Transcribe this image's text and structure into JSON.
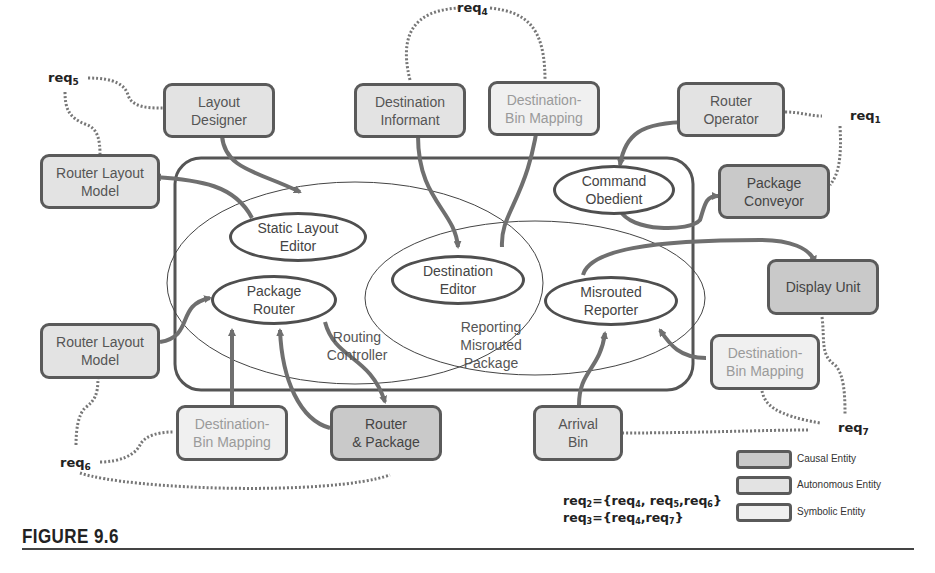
{
  "figure": {
    "caption": "FIGURE 9.6"
  },
  "colors": {
    "causal_fill": "#c9c9c9",
    "autonomous_fill": "#e3e3e3",
    "symbolic_fill": "#f0f0f0",
    "border": "#5a5a5a",
    "arrow": "#6f6f6f"
  },
  "entities": {
    "layout_designer": {
      "label": "Layout\nDesigner",
      "type": "autonomous"
    },
    "destination_informant": {
      "label": "Destination\nInformant",
      "type": "autonomous"
    },
    "dest_bin_mapping_top": {
      "label": "Destination-\nBin Mapping",
      "type": "symbolic"
    },
    "router_operator": {
      "label": "Router\nOperator",
      "type": "autonomous"
    },
    "router_layout_model_top": {
      "label": "Router Layout\nModel",
      "type": "autonomous"
    },
    "package_conveyor": {
      "label": "Package\nConveyor",
      "type": "causal"
    },
    "display_unit": {
      "label": "Display Unit",
      "type": "causal"
    },
    "router_layout_model_bottom": {
      "label": "Router Layout\nModel",
      "type": "autonomous"
    },
    "dest_bin_mapping_right": {
      "label": "Destination-\nBin Mapping",
      "type": "symbolic"
    },
    "dest_bin_mapping_bottom": {
      "label": "Destination-\nBin Mapping",
      "type": "symbolic"
    },
    "router_package": {
      "label": "Router\n& Package",
      "type": "causal"
    },
    "arrival_bin": {
      "label": "Arrival\nBin",
      "type": "autonomous"
    }
  },
  "functions": {
    "static_layout_editor": "Static Layout\nEditor",
    "package_router": "Package\nRouter",
    "destination_editor": "Destination\nEditor",
    "misrouted_reporter": "Misrouted\nReporter",
    "command_obedient": "Command\nObedient"
  },
  "groups": {
    "routing_controller": "Routing\nController",
    "reporting_misrouted_package": "Reporting\nMisrouted\nPackage"
  },
  "requirements": {
    "req1": {
      "base": "req",
      "sub": "1"
    },
    "req4": {
      "base": "req",
      "sub": "4"
    },
    "req5": {
      "base": "req",
      "sub": "5"
    },
    "req6": {
      "base": "req",
      "sub": "6"
    },
    "req7": {
      "base": "req",
      "sub": "7"
    }
  },
  "formulas": {
    "req2": {
      "lhs": "req",
      "lhs_sub": "2",
      "eq": "={",
      "items": [
        {
          "base": "req",
          "sub": "4",
          "sep": ", "
        },
        {
          "base": "req",
          "sub": "5",
          "sep": ","
        },
        {
          "base": "req",
          "sub": "6",
          "sep": ""
        }
      ],
      "close": "}"
    },
    "req3": {
      "lhs": "req",
      "lhs_sub": "3",
      "eq": "={",
      "items": [
        {
          "base": "req",
          "sub": "4",
          "sep": ","
        },
        {
          "base": "req",
          "sub": "7",
          "sep": ""
        }
      ],
      "close": "}"
    }
  },
  "legend": [
    {
      "label": "Causal Entity",
      "fill": "#c9c9c9"
    },
    {
      "label": "Autonomous Entity",
      "fill": "#e3e3e3"
    },
    {
      "label": "Symbolic Entity",
      "fill": "#f0f0f0"
    }
  ]
}
